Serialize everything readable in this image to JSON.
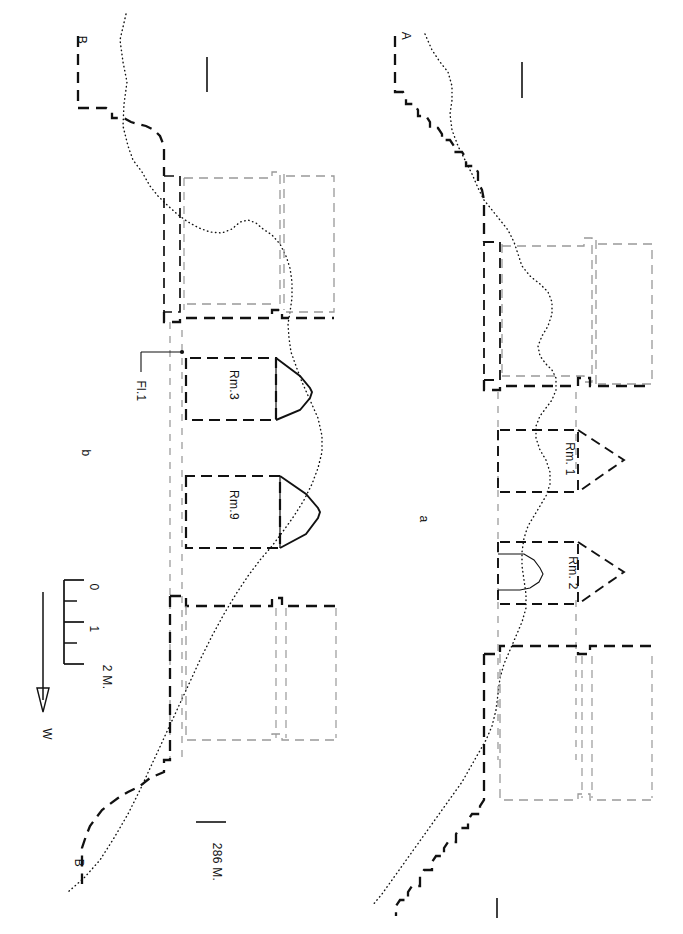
{
  "figure": {
    "kind": "archaeological-cross-section",
    "orientation": "rotated-90-ccw",
    "background_color": "#ffffff",
    "line_color": "#111111"
  },
  "panels": [
    {
      "id": "b",
      "label": "b",
      "section_endpoints": [
        "B",
        "B"
      ]
    },
    {
      "id": "a",
      "label": "a",
      "section_endpoints": [
        "A"
      ]
    }
  ],
  "section_markers": {
    "b_top": "B",
    "b_bottom": "B",
    "a_top": "A"
  },
  "rooms": [
    {
      "id": "rm3",
      "label": "Rm.3",
      "panel": "b"
    },
    {
      "id": "rm9",
      "label": "Rm.9",
      "panel": "b"
    },
    {
      "id": "rm1",
      "label": "Rm. 1",
      "panel": "a"
    },
    {
      "id": "rm2",
      "label": "Rm. 2",
      "panel": "a"
    }
  ],
  "annotations": [
    {
      "id": "floor1",
      "label": "Fl.1",
      "panel": "b",
      "type": "leader-callout"
    },
    {
      "id": "elevation",
      "label": "286 M.",
      "panel": "b",
      "type": "datum-line"
    }
  ],
  "scale_bar": {
    "ticks": [
      "0",
      "1",
      "2 M."
    ],
    "unit": "M.",
    "minor_divisions": 4
  },
  "north_arrow": {
    "label": "W",
    "direction": "west"
  }
}
